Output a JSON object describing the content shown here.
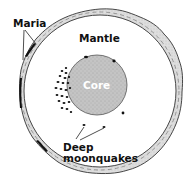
{
  "diagram": {
    "labels": {
      "maria": "Maria",
      "mantle": "Mantle",
      "core": "Core",
      "deep_moonquakes_line1": "Deep",
      "deep_moonquakes_line2": "moonquakes"
    },
    "colors": {
      "crust_fill": "#d8d8d8",
      "core_fill": "#bcbcbc",
      "mantle_fill": "#ffffff",
      "quake_fill": "#111111",
      "maria_fill": "#111111"
    }
  }
}
